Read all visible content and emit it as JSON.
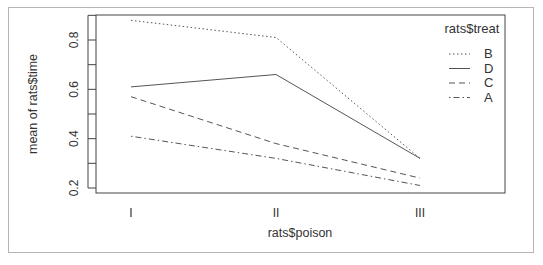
{
  "chart_data": {
    "type": "line",
    "title": "",
    "xlabel": "rats$poison",
    "ylabel": "mean of  rats$time",
    "categories": [
      "I",
      "II",
      "III"
    ],
    "yticks": [
      "0.2",
      "0.4",
      "0.6",
      "0.8"
    ],
    "ylim": [
      0.2,
      0.9
    ],
    "grid": false,
    "legend": {
      "title": "rats$treat",
      "position": "top-right",
      "order": [
        "B",
        "D",
        "C",
        "A"
      ]
    },
    "series": [
      {
        "name": "B",
        "linestyle": "dotted",
        "values": [
          0.88,
          0.81,
          0.32
        ]
      },
      {
        "name": "D",
        "linestyle": "solid",
        "values": [
          0.61,
          0.66,
          0.32
        ]
      },
      {
        "name": "C",
        "linestyle": "dashed",
        "values": [
          0.57,
          0.38,
          0.24
        ]
      },
      {
        "name": "A",
        "linestyle": "dotdash",
        "values": [
          0.41,
          0.32,
          0.21
        ]
      }
    ]
  },
  "colors": {
    "line": "#555555",
    "axis": "#444444",
    "frame": "#b5b5b5"
  }
}
